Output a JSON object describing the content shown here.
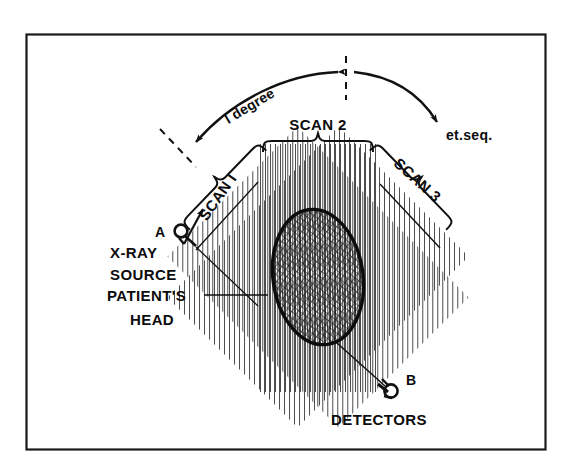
{
  "figure": {
    "kind": "ct-scanner-translate-rotate-diagram",
    "frame": {
      "border_color": "#1a1a1a",
      "background": "#ffffff",
      "x": 26,
      "y": 34,
      "width": 520,
      "height": 416
    },
    "ink_color": "#111111"
  },
  "labels": {
    "scan1": "SCAN I",
    "scan2": "SCAN 2",
    "scan3": "SCAN 3",
    "one_degree": "l degree",
    "et_seq": "et.seq.",
    "source_letter": "A",
    "source_line1": "X-RAY",
    "source_line2": "SOURCE",
    "head_line1": "PATIENT'S",
    "head_line2": "HEAD",
    "detector_letter": "B",
    "detectors": "DETECTORS"
  },
  "geometry": {
    "head": {
      "cx": 318,
      "cy": 277,
      "rx": 45,
      "ry": 68,
      "rotation": -8
    },
    "scan_bands": [
      {
        "name": "scan-1",
        "hatch_angle_deg": 45,
        "band_rotation_deg": -45,
        "line_spacing": 5
      },
      {
        "name": "scan-2",
        "hatch_angle_deg": 90,
        "band_rotation_deg": 0,
        "line_spacing": 5
      },
      {
        "name": "scan-3",
        "hatch_angle_deg": -45,
        "band_rotation_deg": 45,
        "line_spacing": 5
      }
    ],
    "source_marker": {
      "x": 180,
      "y": 232
    },
    "detector_marker": {
      "x": 389,
      "y": 389
    },
    "rotation_arc": {
      "start_deg": 215,
      "end_deg": 325,
      "radius": 150
    }
  }
}
